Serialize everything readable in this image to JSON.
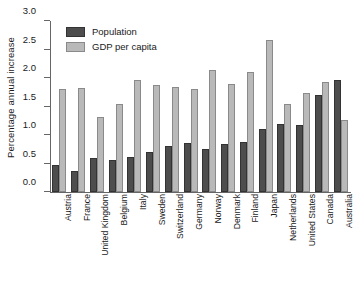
{
  "chart_data": {
    "type": "bar",
    "title": "",
    "xlabel": "",
    "ylabel": "Percentage annual increase",
    "ylim": [
      0.0,
      3.0
    ],
    "ytick_labels": [
      "0.0",
      "0.5",
      "1.0",
      "1.5",
      "2.0",
      "2.5",
      "3.0"
    ],
    "ytick_values": [
      0.0,
      0.5,
      1.0,
      1.5,
      2.0,
      2.5,
      3.0
    ],
    "grid": false,
    "legend_position": "top-left",
    "categories": [
      "Austria",
      "France",
      "United Kingdom",
      "Belgium",
      "Italy",
      "Sweden",
      "Switzerland",
      "Germany",
      "Norway",
      "Denmark",
      "Finland",
      "Japan",
      "Netherlands",
      "United States",
      "Canada",
      "Australia"
    ],
    "series": [
      {
        "name": "Population",
        "color": "#4d4d4d",
        "values": [
          0.47,
          0.36,
          0.59,
          0.57,
          0.62,
          0.71,
          0.81,
          0.86,
          0.76,
          0.85,
          0.88,
          1.1,
          1.19,
          1.18,
          1.71,
          1.97
        ]
      },
      {
        "name": "GDP per capita",
        "color": "#b9b9b9",
        "values": [
          1.81,
          1.83,
          1.32,
          1.54,
          1.96,
          1.88,
          1.85,
          1.8,
          2.14,
          1.89,
          2.11,
          2.66,
          1.55,
          1.74,
          1.93,
          1.27
        ]
      }
    ]
  },
  "legend": {
    "items": [
      {
        "label": "Population"
      },
      {
        "label": "GDP per capita"
      }
    ]
  }
}
